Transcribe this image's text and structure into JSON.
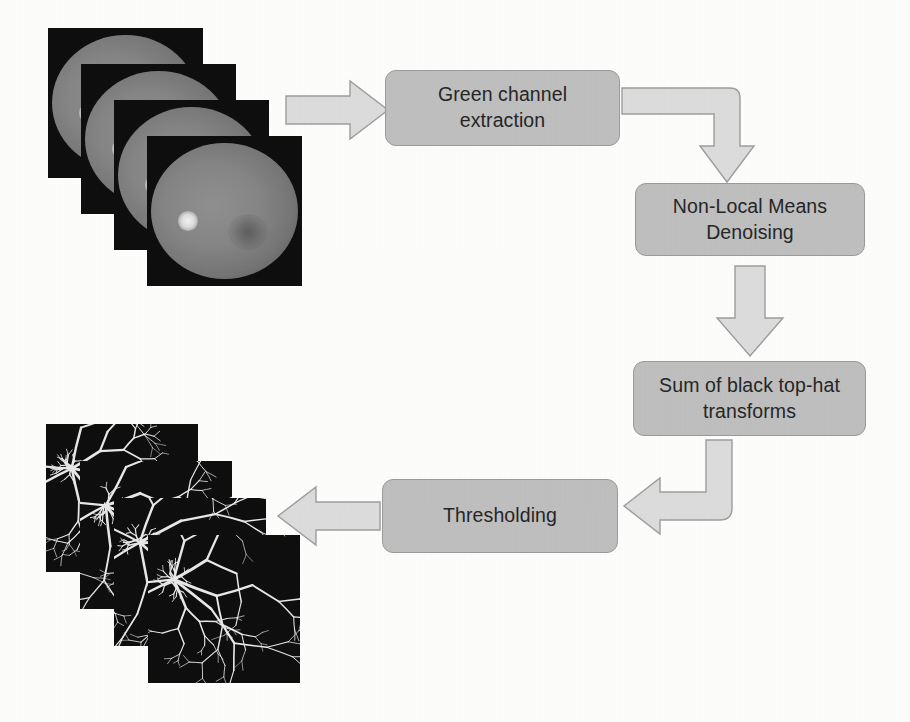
{
  "figure": {
    "background_color": "#fdfdfc",
    "box_fill_color": "#bfbfbf",
    "box_border_color": "#9a9a9a",
    "box_text_color": "#262626",
    "arrow_fill_color": "#dcdcdc",
    "arrow_border_color": "#9d9d9d"
  },
  "stages": [
    {
      "id": "green-channel-extraction",
      "label": "Green channel\nextraction",
      "order": 1,
      "x": 385,
      "y": 70,
      "width": 235,
      "height": 76
    },
    {
      "id": "non-local-means-denoising",
      "label": "Non-Local Means\nDenoising",
      "order": 2,
      "x": 635,
      "y": 183,
      "width": 230,
      "height": 73
    },
    {
      "id": "sum-of-black-top-hat-transforms",
      "label": "Sum of black top-hat\ntransforms",
      "order": 3,
      "x": 633,
      "y": 361,
      "width": 233,
      "height": 75
    },
    {
      "id": "thresholding",
      "label": "Thresholding",
      "order": 4,
      "x": 382,
      "y": 479,
      "width": 236,
      "height": 74
    }
  ],
  "arrows": [
    {
      "id": "arrow-input-to-green-channel",
      "kind": "straight",
      "direction": "right",
      "from": "input-image-stack",
      "to": "green-channel-extraction"
    },
    {
      "id": "arrow-green-channel-to-denoising",
      "kind": "elbow",
      "direction": "right-then-down",
      "from": "green-channel-extraction",
      "to": "non-local-means-denoising"
    },
    {
      "id": "arrow-denoising-to-top-hat",
      "kind": "straight",
      "direction": "down",
      "from": "non-local-means-denoising",
      "to": "sum-of-black-top-hat-transforms"
    },
    {
      "id": "arrow-top-hat-to-thresholding",
      "kind": "elbow",
      "direction": "down-then-left",
      "from": "sum-of-black-top-hat-transforms",
      "to": "thresholding"
    },
    {
      "id": "arrow-thresholding-to-output",
      "kind": "straight",
      "direction": "left",
      "from": "thresholding",
      "to": "output-image-stack"
    }
  ],
  "image_stacks": [
    {
      "id": "input-image-stack",
      "caption": "",
      "kind": "retinal-fundus-photographs",
      "frame_count": 4,
      "x": 48,
      "y": 28,
      "frame_width": 155,
      "frame_height": 150,
      "step_x": 33,
      "step_y": 36,
      "background_color": "#0d0d0d"
    },
    {
      "id": "output-image-stack",
      "caption": "",
      "kind": "segmented-vessel-maps",
      "frame_count": 4,
      "x": 46,
      "y": 424,
      "frame_width": 152,
      "frame_height": 148,
      "step_x": 34,
      "step_y": 37,
      "background_color": "#0d0d0d"
    }
  ]
}
